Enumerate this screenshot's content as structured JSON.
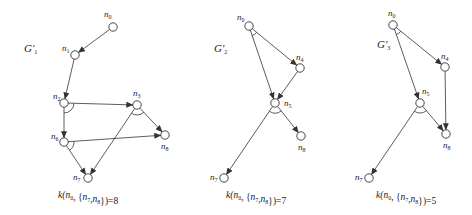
{
  "figure": {
    "graphs": [
      {
        "id": "G1",
        "label": "G'",
        "label_sub": "1",
        "label_pos": [
          24,
          52
        ],
        "caption": "k(n0, {n7,n8})=8",
        "caption_pos": [
          58,
          198
        ],
        "nodes": [
          {
            "id": "n0",
            "x": 113,
            "y": 27,
            "lx": 104,
            "ly": 17
          },
          {
            "id": "n1",
            "x": 75,
            "y": 55,
            "lx": 62,
            "ly": 51
          },
          {
            "id": "n2",
            "x": 64,
            "y": 103,
            "lx": 53,
            "ly": 99
          },
          {
            "id": "n3",
            "x": 137,
            "y": 105,
            "lx": 133,
            "ly": 96
          },
          {
            "id": "n6",
            "x": 64,
            "y": 142,
            "lx": 51,
            "ly": 139
          },
          {
            "id": "n8",
            "x": 165,
            "y": 135,
            "lx": 161,
            "ly": 149
          },
          {
            "id": "n7",
            "x": 88,
            "y": 178,
            "lx": 73,
            "ly": 180
          }
        ],
        "edges": [
          [
            "n0",
            "n1"
          ],
          [
            "n1",
            "n2"
          ],
          [
            "n2",
            "n3"
          ],
          [
            "n2",
            "n6"
          ],
          [
            "n3",
            "n8"
          ],
          [
            "n3",
            "n7"
          ],
          [
            "n6",
            "n8"
          ],
          [
            "n6",
            "n7"
          ]
        ],
        "and_arcs": [
          {
            "at": "n2",
            "a": "n3",
            "b": "n6",
            "r": 10
          },
          {
            "at": "n3",
            "a": "n7",
            "b": "n8",
            "r": 10
          },
          {
            "at": "n6",
            "a": "n8",
            "b": "n7",
            "r": 10
          }
        ]
      },
      {
        "id": "G2",
        "label": "G'",
        "label_sub": "2",
        "label_pos": [
          214,
          52
        ],
        "caption": "k(n0, {n7,n8})=7",
        "caption_pos": [
          226,
          198
        ],
        "nodes": [
          {
            "id": "n0",
            "x": 249,
            "y": 26,
            "lx": 237,
            "ly": 20
          },
          {
            "id": "n4",
            "x": 300,
            "y": 68,
            "lx": 296,
            "ly": 60
          },
          {
            "id": "n5",
            "x": 275,
            "y": 103,
            "lx": 284,
            "ly": 106
          },
          {
            "id": "n8",
            "x": 301,
            "y": 136,
            "lx": 298,
            "ly": 150
          },
          {
            "id": "n7",
            "x": 224,
            "y": 178,
            "lx": 210,
            "ly": 180
          }
        ],
        "edges": [
          [
            "n0",
            "n4"
          ],
          [
            "n0",
            "n5"
          ],
          [
            "n4",
            "n5"
          ],
          [
            "n5",
            "n8"
          ],
          [
            "n5",
            "n7"
          ]
        ],
        "and_arcs": [
          {
            "at": "n0",
            "a": "n5",
            "b": "n4",
            "r": 10
          },
          {
            "at": "n5",
            "a": "n7",
            "b": "n8",
            "r": 10
          }
        ]
      },
      {
        "id": "G3",
        "label": "G'",
        "label_sub": "3",
        "label_pos": [
          377,
          48
        ],
        "caption": "k(n0, {n7,n8})=5",
        "caption_pos": [
          376,
          198
        ],
        "nodes": [
          {
            "id": "n0",
            "x": 393,
            "y": 25,
            "lx": 388,
            "ly": 16
          },
          {
            "id": "n4",
            "x": 445,
            "y": 67,
            "lx": 441,
            "ly": 59
          },
          {
            "id": "n5",
            "x": 420,
            "y": 103,
            "lx": 422,
            "ly": 94
          },
          {
            "id": "n8",
            "x": 446,
            "y": 134,
            "lx": 443,
            "ly": 148
          },
          {
            "id": "n7",
            "x": 369,
            "y": 178,
            "lx": 355,
            "ly": 180
          }
        ],
        "edges": [
          [
            "n0",
            "n4"
          ],
          [
            "n0",
            "n5"
          ],
          [
            "n4",
            "n8"
          ],
          [
            "n5",
            "n8"
          ],
          [
            "n5",
            "n7"
          ]
        ],
        "and_arcs": [
          {
            "at": "n0",
            "a": "n5",
            "b": "n4",
            "r": 10
          },
          {
            "at": "n5",
            "a": "n7",
            "b": "n8",
            "r": 10
          }
        ]
      }
    ],
    "style": {
      "stroke": "#333333",
      "background": "#ffffff",
      "node_radius": 4.2
    }
  }
}
